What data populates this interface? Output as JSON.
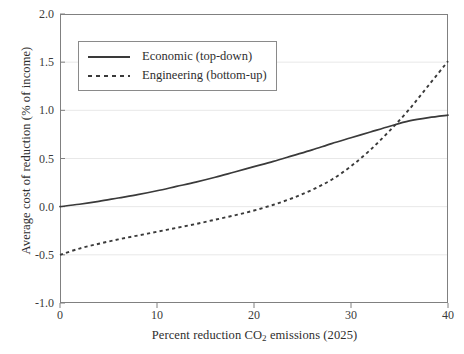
{
  "chart_data": {
    "type": "line",
    "title": "",
    "xlabel": "Percent reduction CO2 emissions (2025)",
    "xlabel_prefix": "Percent reduction CO",
    "xlabel_sub": "2",
    "xlabel_suffix": " emissions (2025)",
    "ylabel": "Average cost of reduction (% of income)",
    "xlim": [
      0,
      40
    ],
    "ylim": [
      -1.0,
      2.0
    ],
    "xticks": [
      "0",
      "10",
      "20",
      "30",
      "40"
    ],
    "xtick_values": [
      0,
      10,
      20,
      30,
      40
    ],
    "yticks": [
      "2.0",
      "1.5",
      "1.0",
      "0.5",
      "0.0",
      "-0.5",
      "-1.0"
    ],
    "ytick_values": [
      2.0,
      1.5,
      1.0,
      0.5,
      0.0,
      -0.5,
      -1.0
    ],
    "grid": "horizontal",
    "legend_position": "upper-left-inside",
    "line_color": "#3a3a3a",
    "grid_color": "#e8e8e8",
    "axis_color": "#808080",
    "crossover_point": {
      "x": 31,
      "y": 0.65
    },
    "x": [
      0,
      2,
      4,
      6,
      8,
      10,
      12,
      14,
      16,
      18,
      20,
      22,
      24,
      26,
      28,
      30,
      32,
      34,
      36,
      38,
      40
    ],
    "series": [
      {
        "name": "Economic (top-down)",
        "style": "solid",
        "values": [
          0.0,
          0.025,
          0.055,
          0.09,
          0.125,
          0.165,
          0.21,
          0.255,
          0.305,
          0.36,
          0.415,
          0.47,
          0.53,
          0.59,
          0.655,
          0.715,
          0.775,
          0.835,
          0.89,
          0.925,
          0.95
        ]
      },
      {
        "name": "Engineering (bottom-up)",
        "style": "dashed",
        "values": [
          -0.5,
          -0.435,
          -0.385,
          -0.34,
          -0.3,
          -0.26,
          -0.22,
          -0.18,
          -0.135,
          -0.09,
          -0.04,
          0.02,
          0.09,
          0.175,
          0.28,
          0.42,
          0.59,
          0.79,
          1.01,
          1.26,
          1.51
        ]
      }
    ]
  },
  "legend": {
    "items": [
      {
        "label": "Economic (top-down)",
        "style": "solid"
      },
      {
        "label": "Engineering (bottom-up)",
        "style": "dashed"
      }
    ]
  }
}
